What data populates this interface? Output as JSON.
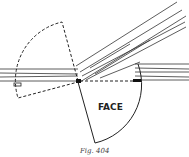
{
  "diagram": {
    "face_label": "FACE",
    "caption": "Fig. 404"
  }
}
